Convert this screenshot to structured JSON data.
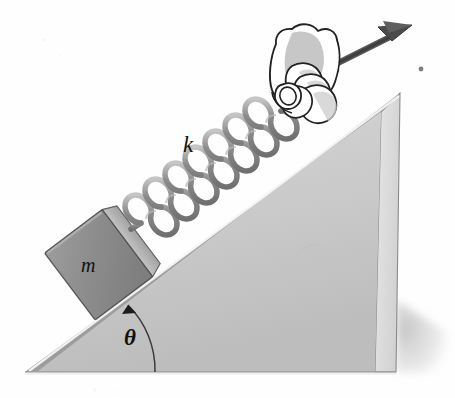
{
  "figure": {
    "background_color": "#fefefe"
  },
  "labels": {
    "spring_constant": "k",
    "mass": "m",
    "angle": "θ"
  },
  "icons": {
    "force_arrow": "arrow-up-right-icon",
    "hand": "hand-gripping-icon",
    "spring": "coil-spring-icon",
    "block": "block-icon",
    "incline": "wedge-icon",
    "angle_arc": "angle-arc-icon",
    "dot": "stray-dot-icon"
  },
  "colors": {
    "wedge_front": "#c8c8c8",
    "wedge_side": "#dcdcdc",
    "wedge_top_edge": "#a0a0a0",
    "block_face": "#8f8f8f",
    "block_side": "#b5b5b5",
    "spring": "#909090",
    "outline": "#2b2b2b",
    "arrow": "#4a4a4a",
    "shadow": "#d8d8d8",
    "hand_fill": "#ffffff",
    "hand_shade": "#b9b9b9"
  },
  "geometry": {
    "incline_angle_degrees": 37,
    "wedge_base_left_x": 25,
    "wedge_base_right_x": 396,
    "wedge_base_y": 372,
    "wedge_apex_x": 400,
    "wedge_apex_y": 93,
    "block_center_x": 99,
    "block_center_y": 262,
    "spring_start_x": 131,
    "spring_start_y": 229,
    "spring_end_x": 294,
    "spring_end_y": 106,
    "spring_coils": 11,
    "arrow_tail_x": 296,
    "arrow_tail_y": 83,
    "arrow_head_x": 409,
    "arrow_head_y": 27,
    "angle_arc_radius": 90
  }
}
